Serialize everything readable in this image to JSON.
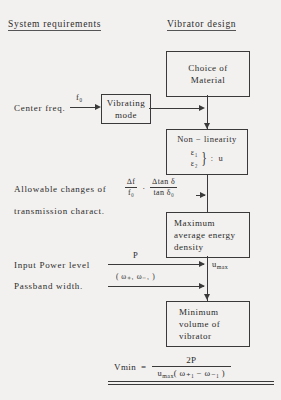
{
  "headers": {
    "left": "System requirements",
    "right": "Vibrator design"
  },
  "boxes": {
    "choice_material": {
      "line1": "Choice of",
      "line2": "Material"
    },
    "vibrating_mode": {
      "line1": "Vibrating",
      "line2": "mode"
    },
    "nonlinearity": {
      "title": "Non − linearity",
      "eps1": "ε₁",
      "eps2": "ε₂",
      "brace": "}",
      "colon": ":",
      "u": "u"
    },
    "max_energy": {
      "line1": "Maximum",
      "line2": "average  energy",
      "line3": "density"
    },
    "min_volume": {
      "line1": "Minimum",
      "line2": "volume  of",
      "line3": "vibrator"
    }
  },
  "labels": {
    "center_freq": "Center  freq.",
    "center_freq_arrow": "f₀",
    "allowable_changes": "Allowable  changes  of",
    "transmission_charact": "transmission  charact.",
    "input_power": "Input  Power  level",
    "input_power_arrow": "P",
    "passband_width": "Passband width.",
    "passband_arrow": "( ω₊₁      ω₋₁ )",
    "u_max": "u",
    "u_max_sub": "max",
    "dot_separator": "·"
  },
  "fractions": {
    "delta_f": {
      "numerator": "∆f",
      "denominator": "f₀"
    },
    "delta_tan": {
      "numerator": "∆tan δ",
      "denominator": "tan δ₀"
    }
  },
  "formula": {
    "lhs": "Vmin",
    "equals": "=",
    "numerator": "2P",
    "denominator_u": "u",
    "denominator_u_sub": "max",
    "denominator_rest": "( ω₊₁  −  ω₋₁ )"
  },
  "colors": {
    "ink": "#3a3a3a",
    "background": "#f2f1ef"
  }
}
